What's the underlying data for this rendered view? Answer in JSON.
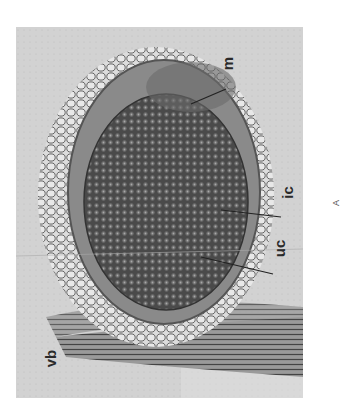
{
  "figure": {
    "panel_label": "A",
    "labels": {
      "m": "m",
      "ic": "ic",
      "uc": "uc",
      "vb": "vb"
    }
  }
}
